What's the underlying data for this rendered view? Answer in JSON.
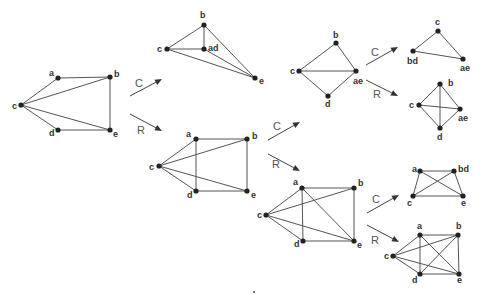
{
  "operations": {
    "contract": "C",
    "remove": "R"
  },
  "colors": {
    "edge": "#555555",
    "node": "#222222",
    "label": "#333333",
    "arrow": "#444444"
  },
  "graphs": [
    {
      "id": "G",
      "nodes": [
        {
          "id": "a",
          "x": 58,
          "y": 78,
          "label": "a",
          "lx": 49,
          "ly": 76
        },
        {
          "id": "b",
          "x": 110,
          "y": 77,
          "label": "b",
          "lx": 114,
          "ly": 77
        },
        {
          "id": "c",
          "x": 21,
          "y": 105,
          "label": "c",
          "lx": 12,
          "ly": 109
        },
        {
          "id": "d",
          "x": 58,
          "y": 130,
          "label": "d",
          "lx": 49,
          "ly": 136
        },
        {
          "id": "e",
          "x": 110,
          "y": 130,
          "label": "e",
          "lx": 113,
          "ly": 137
        }
      ],
      "edges": [
        [
          "a",
          "b"
        ],
        [
          "a",
          "c"
        ],
        [
          "c",
          "b"
        ],
        [
          "c",
          "d"
        ],
        [
          "c",
          "e"
        ],
        [
          "d",
          "e"
        ],
        [
          "b",
          "e"
        ]
      ]
    },
    {
      "id": "G/C-ad",
      "nodes": [
        {
          "id": "b",
          "x": 204,
          "y": 25,
          "label": "b",
          "lx": 200,
          "ly": 18
        },
        {
          "id": "c",
          "x": 167,
          "y": 49,
          "label": "c",
          "lx": 157,
          "ly": 52
        },
        {
          "id": "ad",
          "x": 204,
          "y": 49,
          "label": "ad",
          "lx": 208,
          "ly": 51
        },
        {
          "id": "e",
          "x": 255,
          "y": 78,
          "label": "e",
          "lx": 259,
          "ly": 84
        }
      ],
      "edges": [
        [
          "b",
          "c"
        ],
        [
          "b",
          "ad"
        ],
        [
          "b",
          "e"
        ],
        [
          "c",
          "ad"
        ],
        [
          "c",
          "e"
        ],
        [
          "ad",
          "e"
        ]
      ]
    },
    {
      "id": "G-R-ad",
      "nodes": [
        {
          "id": "a",
          "x": 196,
          "y": 139,
          "label": "a",
          "lx": 186,
          "ly": 137
        },
        {
          "id": "b",
          "x": 247,
          "y": 139,
          "label": "b",
          "lx": 252,
          "ly": 139
        },
        {
          "id": "c",
          "x": 159,
          "y": 166,
          "label": "c",
          "lx": 149,
          "ly": 170
        },
        {
          "id": "d",
          "x": 196,
          "y": 191,
          "label": "d",
          "lx": 187,
          "ly": 198
        },
        {
          "id": "e",
          "x": 247,
          "y": 191,
          "label": "e",
          "lx": 251,
          "ly": 198
        }
      ],
      "edges": [
        [
          "a",
          "b"
        ],
        [
          "a",
          "c"
        ],
        [
          "a",
          "d"
        ],
        [
          "c",
          "b"
        ],
        [
          "c",
          "d"
        ],
        [
          "c",
          "e"
        ],
        [
          "d",
          "e"
        ],
        [
          "b",
          "e"
        ]
      ]
    },
    {
      "id": "C2",
      "nodes": [
        {
          "id": "b",
          "x": 336,
          "y": 43,
          "label": "b",
          "lx": 333,
          "ly": 38
        },
        {
          "id": "c",
          "x": 299,
          "y": 71,
          "label": "c",
          "lx": 290,
          "ly": 74
        },
        {
          "id": "ae",
          "x": 356,
          "y": 71,
          "label": "ae",
          "lx": 353,
          "ly": 84
        },
        {
          "id": "d",
          "x": 328,
          "y": 96,
          "label": "d",
          "lx": 325,
          "ly": 107
        }
      ],
      "edges": [
        [
          "b",
          "c"
        ],
        [
          "b",
          "ae"
        ],
        [
          "c",
          "ae"
        ],
        [
          "c",
          "d"
        ],
        [
          "d",
          "ae"
        ]
      ]
    },
    {
      "id": "C3",
      "nodes": [
        {
          "id": "c",
          "x": 438,
          "y": 31,
          "label": "c",
          "lx": 435,
          "ly": 25
        },
        {
          "id": "bd",
          "x": 413,
          "y": 51,
          "label": "bd",
          "lx": 407,
          "ly": 64
        },
        {
          "id": "ae",
          "x": 463,
          "y": 59,
          "label": "ae",
          "lx": 460,
          "ly": 71
        }
      ],
      "edges": [
        [
          "c",
          "bd"
        ],
        [
          "c",
          "ae"
        ],
        [
          "bd",
          "ae"
        ]
      ]
    },
    {
      "id": "R3",
      "nodes": [
        {
          "id": "b",
          "x": 440,
          "y": 84,
          "label": "b",
          "lx": 448,
          "ly": 86
        },
        {
          "id": "c",
          "x": 419,
          "y": 105,
          "label": "c",
          "lx": 409,
          "ly": 108
        },
        {
          "id": "ae",
          "x": 460,
          "y": 109,
          "label": "ae",
          "lx": 458,
          "ly": 121
        },
        {
          "id": "d",
          "x": 440,
          "y": 128,
          "label": "d",
          "lx": 437,
          "ly": 140
        }
      ],
      "edges": [
        [
          "b",
          "c"
        ],
        [
          "b",
          "ae"
        ],
        [
          "b",
          "d"
        ],
        [
          "c",
          "ae"
        ],
        [
          "c",
          "d"
        ],
        [
          "d",
          "ae"
        ]
      ]
    },
    {
      "id": "R2",
      "nodes": [
        {
          "id": "a",
          "x": 302,
          "y": 188,
          "label": "a",
          "lx": 293,
          "ly": 185
        },
        {
          "id": "b",
          "x": 354,
          "y": 188,
          "label": "b",
          "lx": 358,
          "ly": 186
        },
        {
          "id": "c",
          "x": 266,
          "y": 215,
          "label": "c",
          "lx": 257,
          "ly": 218
        },
        {
          "id": "d",
          "x": 303,
          "y": 241,
          "label": "d",
          "lx": 294,
          "ly": 247
        },
        {
          "id": "e",
          "x": 354,
          "y": 241,
          "label": "e",
          "lx": 357,
          "ly": 248
        }
      ],
      "edges": [
        [
          "a",
          "b"
        ],
        [
          "a",
          "c"
        ],
        [
          "a",
          "d"
        ],
        [
          "a",
          "e"
        ],
        [
          "c",
          "b"
        ],
        [
          "c",
          "d"
        ],
        [
          "c",
          "e"
        ],
        [
          "d",
          "e"
        ],
        [
          "b",
          "e"
        ]
      ]
    },
    {
      "id": "C4",
      "nodes": [
        {
          "id": "a",
          "x": 420,
          "y": 171,
          "label": "a",
          "lx": 412,
          "ly": 172
        },
        {
          "id": "bd",
          "x": 454,
          "y": 171,
          "label": "bd",
          "lx": 458,
          "ly": 172
        },
        {
          "id": "c",
          "x": 413,
          "y": 196,
          "label": "c",
          "lx": 407,
          "ly": 206
        },
        {
          "id": "e",
          "x": 463,
          "y": 196,
          "label": "e",
          "lx": 461,
          "ly": 206
        }
      ],
      "edges": [
        [
          "a",
          "bd"
        ],
        [
          "a",
          "c"
        ],
        [
          "a",
          "e"
        ],
        [
          "c",
          "bd"
        ],
        [
          "c",
          "e"
        ],
        [
          "bd",
          "e"
        ]
      ]
    },
    {
      "id": "R4",
      "nodes": [
        {
          "id": "a",
          "x": 420,
          "y": 235,
          "label": "a",
          "lx": 417,
          "ly": 229
        },
        {
          "id": "b",
          "x": 458,
          "y": 235,
          "label": "b",
          "lx": 456,
          "ly": 229
        },
        {
          "id": "c",
          "x": 393,
          "y": 256,
          "label": "c",
          "lx": 384,
          "ly": 259
        },
        {
          "id": "d",
          "x": 420,
          "y": 274,
          "label": "d",
          "lx": 412,
          "ly": 283
        },
        {
          "id": "e",
          "x": 459,
          "y": 274,
          "label": "e",
          "lx": 457,
          "ly": 283
        }
      ],
      "edges": [
        [
          "a",
          "b"
        ],
        [
          "a",
          "c"
        ],
        [
          "a",
          "d"
        ],
        [
          "a",
          "e"
        ],
        [
          "c",
          "b"
        ],
        [
          "c",
          "d"
        ],
        [
          "c",
          "e"
        ],
        [
          "d",
          "b"
        ],
        [
          "d",
          "e"
        ],
        [
          "b",
          "e"
        ]
      ]
    }
  ],
  "arrows": [
    {
      "op": "C",
      "x1": 130,
      "y1": 96,
      "x2": 162,
      "y2": 79,
      "lx": 135,
      "ly": 87
    },
    {
      "op": "R",
      "x1": 130,
      "y1": 114,
      "x2": 162,
      "y2": 131,
      "lx": 137,
      "ly": 134
    },
    {
      "op": "C",
      "x1": 268,
      "y1": 140,
      "x2": 300,
      "y2": 122,
      "lx": 273,
      "ly": 130
    },
    {
      "op": "R",
      "x1": 268,
      "y1": 154,
      "x2": 300,
      "y2": 171,
      "lx": 272,
      "ly": 168
    },
    {
      "op": "C",
      "x1": 366,
      "y1": 65,
      "x2": 398,
      "y2": 47,
      "lx": 371,
      "ly": 56
    },
    {
      "op": "R",
      "x1": 366,
      "y1": 80,
      "x2": 398,
      "y2": 96,
      "lx": 373,
      "ly": 98
    },
    {
      "op": "C",
      "x1": 367,
      "y1": 213,
      "x2": 399,
      "y2": 195,
      "lx": 372,
      "ly": 203
    },
    {
      "op": "R",
      "x1": 367,
      "y1": 225,
      "x2": 399,
      "y2": 242,
      "lx": 371,
      "ly": 244
    }
  ]
}
